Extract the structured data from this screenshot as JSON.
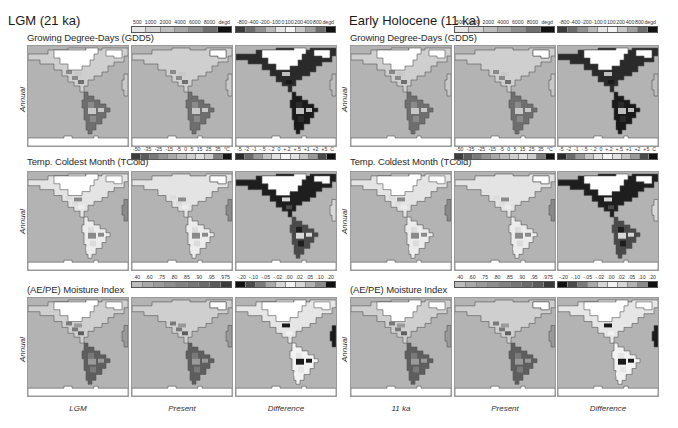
{
  "groups": [
    {
      "title": "LGM (21 ka)",
      "columns": [
        "LGM",
        "Present",
        "Difference"
      ]
    },
    {
      "title": "Early Holocene (11 ka)",
      "columns": [
        "11 ka",
        "Present",
        "Difference"
      ]
    }
  ],
  "rows": [
    {
      "title": "Growing Degree-Days (GDD5)",
      "side_label": "Annual",
      "abs_colorbar": {
        "labels": [
          "500",
          "1000",
          "2000",
          "4000",
          "6000",
          "8000",
          "degd"
        ],
        "colors": [
          "#e6e6e6",
          "#d2d2d2",
          "#bdbdbd",
          "#a6a6a6",
          "#8e8e8e",
          "#6e6e6e",
          "#111111"
        ]
      },
      "diff_colorbar": {
        "labels": [
          "-800",
          "-400",
          "-200",
          "-100",
          "0",
          "100",
          "200",
          "400",
          "800",
          "degd"
        ],
        "colors": [
          "#3a3a3a",
          "#6a6a6a",
          "#909090",
          "#b8b8b8",
          "#e4e4e4",
          "#f2f2f2",
          "#c8c8c8",
          "#a0a0a0",
          "#6c6c6c",
          "#111111"
        ]
      }
    },
    {
      "title": "Temp. Coldest Month (TCold)",
      "side_label": "Annual",
      "abs_colorbar": {
        "labels": [
          "-50",
          "-35",
          "-25",
          "-15",
          "-5",
          "0",
          "5",
          "15",
          "25",
          "35",
          "°C"
        ],
        "colors": [
          "#3c3c3c",
          "#5c5c5c",
          "#7a7a7a",
          "#949494",
          "#aaaaaa",
          "#bdbdbd",
          "#d0d0d0",
          "#e0e0e0",
          "#cfcfcf",
          "#7e7e7e",
          "#141414"
        ]
      },
      "diff_colorbar": {
        "labels": [
          "-5",
          "-2",
          "-1",
          "-.5",
          "-.2",
          "0",
          "+.2",
          "+.5",
          "+1",
          "+2",
          "+5",
          "C"
        ],
        "colors": [
          "#2a2a2a",
          "#6a6a6a",
          "#9a9a9a",
          "#c4c4c4",
          "#e2e2e2",
          "#f4f4f4",
          "#e2e2e2",
          "#c4c4c4",
          "#9a9a9a",
          "#4a4a4a",
          "#111111"
        ]
      }
    },
    {
      "title": "(AE/PE) Moisture Index",
      "side_label": "Annual",
      "abs_colorbar": {
        "labels": [
          ".40",
          ".60",
          ".75",
          ".80",
          ".85",
          ".90",
          ".95",
          ".975"
        ],
        "colors": [
          "#bcbcbc",
          "#a8a8a8",
          "#9a9a9a",
          "#8e8e8e",
          "#828282",
          "#767676",
          "#6a6a6a",
          "#5a5a5a",
          "#3a3a3a"
        ]
      },
      "diff_colorbar": {
        "labels": [
          "-.20",
          "-.10",
          "-.05",
          "-.02",
          ".00",
          ".02",
          ".05",
          ".10",
          ".20"
        ],
        "colors": [
          "#111111",
          "#4a4a4a",
          "#7a7a7a",
          "#a8a8a8",
          "#d6d6d6",
          "#f2f2f2",
          "#d6d6d6",
          "#b2b2b2",
          "#8a8a8a",
          "#111111"
        ]
      }
    }
  ]
}
